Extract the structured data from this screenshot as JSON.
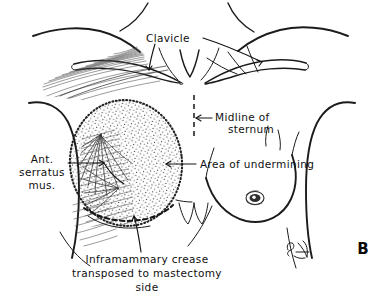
{
  "figure": {
    "panel_label": "B",
    "background_color": "#ffffff",
    "ink_color": "#1b1b1b"
  },
  "labels": {
    "clavicle": "Clavicle",
    "midline_line1": "Midline of",
    "midline_line2": "sternum",
    "serratus_line1": "Ant.",
    "serratus_line2": "serratus",
    "serratus_line3": "mus.",
    "undermining": "Area of undermining",
    "caption_line1": "Inframammary crease",
    "caption_line2": "transposed to mastectomy",
    "caption_line3": "side"
  },
  "annotations": {
    "midline_marker": "vertical dashed line marking sternal midline",
    "undermining_region": "stippled oval over left chest wall",
    "crease_curve": "bold dashed arc across lower stippled oval",
    "serratus_hatching": "fanned muscle digitations on lateral chest",
    "pectoral_hatching": "fine fibers below left clavicle",
    "nipple": "right breast nipple",
    "xiphoid": "costal margin notch at midline",
    "artist_mark": "artist signature marks"
  }
}
